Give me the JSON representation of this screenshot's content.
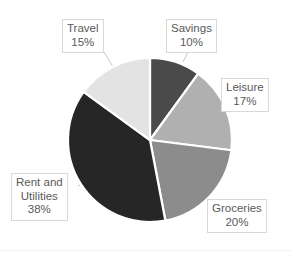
{
  "chart_data": {
    "type": "pie",
    "title": "",
    "categories": [
      "Savings",
      "Leisure",
      "Groceries",
      "Rent and Utilities",
      "Travel"
    ],
    "values": [
      10,
      17,
      20,
      38,
      15
    ],
    "value_unit": "%",
    "legend": "none",
    "grid": false,
    "start_angle_deg": 0,
    "direction": "clockwise",
    "slice_colors": [
      "#4a4a4a",
      "#b0b0b0",
      "#8c8c8c",
      "#262626",
      "#e3e3e3"
    ],
    "slice_border_color": "#ffffff",
    "slices": [
      {
        "label": "Savings",
        "value": 10,
        "display": "10%",
        "color": "#4a4a4a"
      },
      {
        "label": "Leisure",
        "value": 17,
        "display": "17%",
        "color": "#b0b0b0"
      },
      {
        "label": "Groceries",
        "value": 20,
        "display": "20%",
        "color": "#8c8c8c"
      },
      {
        "label": "Rent and Utilities",
        "value": 38,
        "display": "38%",
        "color": "#262626"
      },
      {
        "label": "Travel",
        "value": 15,
        "display": "15%",
        "color": "#e3e3e3"
      }
    ]
  },
  "labels": {
    "savings": {
      "line1": "Savings",
      "line2": "10%"
    },
    "leisure": {
      "line1": "Leisure",
      "line2": "17%"
    },
    "groceries": {
      "line1": "Groceries",
      "line2": "20%"
    },
    "rent": {
      "line1": "Rent and",
      "line2": "Utilities",
      "line3": "38%"
    },
    "travel": {
      "line1": "Travel",
      "line2": "15%"
    }
  },
  "style": {
    "background": "#ffffff",
    "label_text_color": "#595959",
    "label_box_border": "#d9d9d9",
    "leader_line_color": "#bfbfbf"
  }
}
